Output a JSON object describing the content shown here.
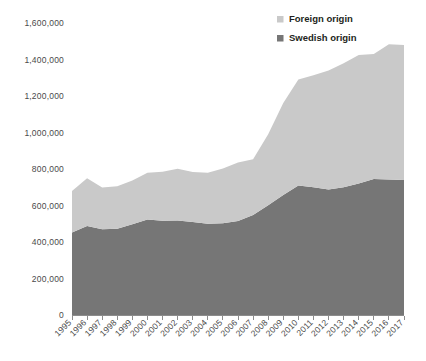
{
  "chart_data": {
    "type": "area",
    "title": "",
    "subtitle": "",
    "xlabel": "",
    "ylabel": "",
    "stacked": true,
    "grid": false,
    "legend_position": "top-right",
    "ylim": [
      0,
      1600000
    ],
    "ytick_step": 200000,
    "ytick_labels": [
      "1,600,000",
      "1,400,000",
      "1,200,000",
      "1,000,000",
      "800,000",
      "600,000",
      "400,000",
      "200,000",
      "0"
    ],
    "ytick_values": [
      1600000,
      1400000,
      1200000,
      1000000,
      800000,
      600000,
      400000,
      200000,
      0
    ],
    "categories": [
      "1995",
      "1996",
      "1997",
      "1998",
      "1999",
      "2000",
      "2001",
      "2002",
      "2003",
      "2004",
      "2005",
      "2006",
      "2007",
      "2008",
      "2009",
      "2010",
      "2011",
      "2012",
      "2013",
      "2014",
      "2015",
      "2016",
      "2017"
    ],
    "series": [
      {
        "name": "Swedish origin",
        "color": "#767676",
        "values": [
          452000,
          487000,
          470000,
          472000,
          497000,
          523000,
          516000,
          518000,
          509000,
          500000,
          503000,
          515000,
          548000,
          601000,
          657000,
          710000,
          700000,
          688000,
          700000,
          720000,
          745000,
          742000,
          740000
        ]
      },
      {
        "name": "Foreign origin",
        "color": "#c9c9c9",
        "values": [
          228000,
          262000,
          228000,
          233000,
          240000,
          257000,
          269000,
          284000,
          274000,
          279000,
          300000,
          320000,
          305000,
          389000,
          505000,
          580000,
          614000,
          652000,
          679000,
          705000,
          685000,
          741000,
          740000
        ]
      }
    ],
    "totals": [
      680000,
      749000,
      698000,
      705000,
      737000,
      780000,
      785000,
      802000,
      783000,
      779000,
      803000,
      835000,
      853000,
      990000,
      1162000,
      1290000,
      1314000,
      1340000,
      1379000,
      1425000,
      1430000,
      1483000,
      1480000
    ]
  },
  "legend": {
    "items": [
      {
        "label": "Foreign origin",
        "color": "#c9c9c9"
      },
      {
        "label": "Swedish origin",
        "color": "#767676"
      }
    ]
  },
  "axes": {
    "baseline_label": "0"
  }
}
